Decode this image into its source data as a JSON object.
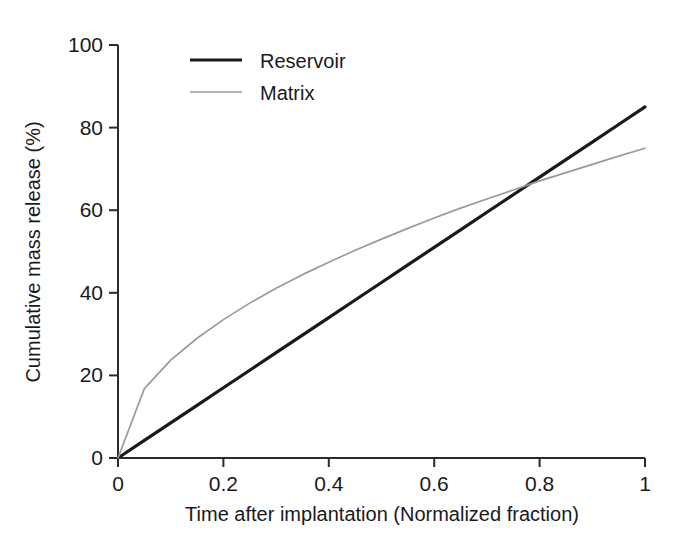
{
  "chart_data": {
    "type": "line",
    "title": "",
    "xlabel": "Time after implantation (Normalized fraction)",
    "ylabel": "Cumulative mass release (%)",
    "xlim": [
      0,
      1
    ],
    "ylim": [
      0,
      100
    ],
    "grid": false,
    "legend_position": "top-center-left",
    "xticks": [
      "0",
      "0.2",
      "0.4",
      "0.6",
      "0.8",
      "1"
    ],
    "xtick_values": [
      0,
      0.2,
      0.4,
      0.6,
      0.8,
      1
    ],
    "yticks": [
      "0",
      "20",
      "40",
      "60",
      "80",
      "100"
    ],
    "ytick_values": [
      0,
      20,
      40,
      60,
      80,
      100
    ],
    "x": [
      0,
      0.05,
      0.1,
      0.15,
      0.2,
      0.25,
      0.3,
      0.35,
      0.4,
      0.45,
      0.5,
      0.55,
      0.6,
      0.65,
      0.7,
      0.75,
      0.8,
      0.85,
      0.9,
      0.95,
      1
    ],
    "series": [
      {
        "name": "Reservoir",
        "color": "#1a1a1a",
        "line_width": 3.2,
        "values": [
          0,
          4.25,
          8.5,
          12.75,
          17,
          21.25,
          25.5,
          29.75,
          34,
          38.25,
          42.5,
          46.75,
          51,
          55.25,
          59.5,
          63.75,
          68,
          72.25,
          76.5,
          80.75,
          85
        ]
      },
      {
        "name": "Matrix",
        "color": "#9a9a9a",
        "line_width": 1.7,
        "values": [
          0,
          16.8,
          23.7,
          29.0,
          33.5,
          37.5,
          41.1,
          44.4,
          47.4,
          50.3,
          53.0,
          55.6,
          58.1,
          60.5,
          62.7,
          64.9,
          67.1,
          69.1,
          71.1,
          73.1,
          75
        ]
      }
    ],
    "annotations": []
  },
  "legend": {
    "items": [
      {
        "label": "Reservoir",
        "color": "#1a1a1a",
        "line_width": 3.2
      },
      {
        "label": "Matrix",
        "color": "#9a9a9a",
        "line_width": 1.7
      }
    ]
  },
  "axes": {
    "x_title": "Time after implantation (Normalized fraction)",
    "y_title": "Cumulative mass release (%)",
    "x_tick_labels": [
      "0",
      "0.2",
      "0.4",
      "0.6",
      "0.8",
      "1"
    ],
    "y_tick_labels": [
      "0",
      "20",
      "40",
      "60",
      "80",
      "100"
    ],
    "axis_color": "#2b2b2b"
  }
}
